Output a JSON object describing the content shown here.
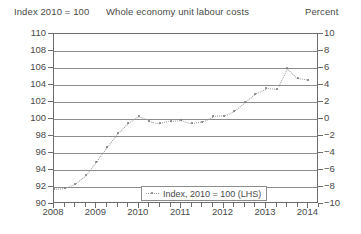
{
  "titles": {
    "left_axis": "Index 2010 = 100",
    "main": "Whole economy unit labour costs",
    "right_axis": "Percent"
  },
  "legend": {
    "label": "Index, 2010 = 100 (LHS)",
    "marker": "dotted-line-with-dots-icon"
  },
  "chart_data": {
    "type": "line",
    "title": "Whole economy unit labour costs",
    "xlabel": "",
    "ylabel": "Index 2010 = 100",
    "y2label": "Percent",
    "ylim": [
      90,
      110
    ],
    "ytick_step": 2,
    "y2lim": [
      -10,
      10
    ],
    "y2tick_step": 2,
    "yticks": [
      90,
      92,
      94,
      96,
      98,
      100,
      102,
      104,
      106,
      108,
      110
    ],
    "y2ticks": [
      -10,
      -8,
      -6,
      -4,
      -2,
      0,
      2,
      4,
      6,
      8,
      10
    ],
    "xticks": [
      2008,
      2009,
      2010,
      2011,
      2012,
      2013,
      2014
    ],
    "xlim": [
      2008,
      2014.25
    ],
    "x_minor_interval": "quarterly",
    "grid": true,
    "legend_position": "bottom-center",
    "series": [
      {
        "name": "Index, 2010 = 100 (LHS)",
        "axis": "left",
        "style": "dotted-line-markers",
        "color": "#7a7a7a",
        "x": [
          2008.0,
          2008.25,
          2008.5,
          2008.75,
          2009.0,
          2009.25,
          2009.5,
          2009.75,
          2010.0,
          2010.25,
          2010.5,
          2010.75,
          2011.0,
          2011.25,
          2011.5,
          2011.75,
          2012.0,
          2012.25,
          2012.5,
          2012.75,
          2013.0,
          2013.25,
          2013.5,
          2013.75,
          2014.0
        ],
        "values": [
          91.8,
          91.9,
          92.4,
          93.4,
          95.0,
          96.7,
          98.3,
          99.5,
          100.3,
          99.8,
          99.5,
          99.8,
          99.9,
          99.5,
          99.7,
          100.3,
          100.4,
          101.0,
          102.0,
          103.0,
          103.6,
          103.5,
          106.0,
          104.8,
          104.6
        ]
      }
    ]
  }
}
